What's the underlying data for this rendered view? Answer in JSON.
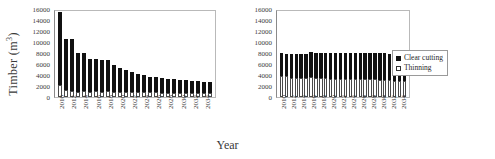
{
  "figure": {
    "xlabel": "Year",
    "ylabel_text": "Timber (m",
    "ylabel_unit": "3",
    "ylabel_close": ")"
  },
  "legend": {
    "position": "right",
    "items": [
      {
        "label": "Clear cutting",
        "swatch": "filled-black-square"
      },
      {
        "label": "Thinning",
        "swatch": "open-white-square"
      }
    ]
  },
  "axis": {
    "yticks": [
      16000,
      14000,
      12000,
      10000,
      8000,
      6000,
      4000,
      2000,
      0
    ],
    "ylim": [
      0,
      16000
    ],
    "ytick_labels": [
      "16000",
      "14000",
      "12000",
      "10000",
      "8000",
      "6000",
      "4000",
      "2000",
      "0"
    ]
  },
  "chart_data": [
    {
      "id": "left-panel",
      "type": "bar",
      "stacked": true,
      "title": "",
      "xlabel": "Year",
      "ylabel": "Timber (m3)",
      "ylim": [
        0,
        16000
      ],
      "grid": false,
      "legend": "none",
      "categories": [
        "2010",
        "2011",
        "2012",
        "2013",
        "2014",
        "2015",
        "2016",
        "2017",
        "2018",
        "2019",
        "2020",
        "2021",
        "2022",
        "2023",
        "2024",
        "2025",
        "2026",
        "2027",
        "2028",
        "2029",
        "2030",
        "2031",
        "2032",
        "2033",
        "2034",
        "2035"
      ],
      "tick_labels_shown": [
        "2010",
        "",
        "2012",
        "",
        "2014",
        "",
        "2016",
        "",
        "2018",
        "",
        "2020",
        "",
        "2022",
        "",
        "2024",
        "",
        "2026",
        "",
        "2028",
        "",
        "2030",
        "",
        "2032",
        "",
        "2034",
        ""
      ],
      "series": [
        {
          "name": "Thinning",
          "values": [
            2100,
            1300,
            1100,
            900,
            1100,
            1000,
            1050,
            1000,
            1050,
            1000,
            1000,
            950,
            950,
            900,
            900,
            850,
            850,
            800,
            800,
            800,
            750,
            750,
            750,
            700,
            700,
            700
          ]
        },
        {
          "name": "Clear cutting",
          "values": [
            13400,
            9300,
            9400,
            7100,
            6900,
            6000,
            5800,
            5700,
            5600,
            4750,
            4250,
            3900,
            3550,
            3300,
            3050,
            2850,
            2750,
            2700,
            2550,
            2450,
            2350,
            2300,
            2250,
            2150,
            2100,
            2000
          ]
        }
      ],
      "totals": [
        15500,
        10600,
        10500,
        8000,
        8000,
        7000,
        6850,
        6700,
        6650,
        5750,
        5250,
        4850,
        4500,
        4200,
        3950,
        3700,
        3600,
        3500,
        3350,
        3250,
        3100,
        3050,
        3000,
        2850,
        2800,
        2700
      ]
    },
    {
      "id": "right-panel",
      "type": "bar",
      "stacked": true,
      "title": "",
      "xlabel": "Year",
      "ylabel": "",
      "ylim": [
        0,
        16000
      ],
      "grid": false,
      "legend": "right",
      "categories": [
        "2010",
        "2011",
        "2012",
        "2013",
        "2014",
        "2015",
        "2016",
        "2017",
        "2018",
        "2019",
        "2020",
        "2021",
        "2022",
        "2023",
        "2024",
        "2025",
        "2026",
        "2027",
        "2028",
        "2029",
        "2030",
        "2031",
        "2032",
        "2033",
        "2034",
        "2035"
      ],
      "tick_labels_shown": [
        "2010",
        "",
        "2012",
        "",
        "2014",
        "",
        "2016",
        "",
        "2018",
        "",
        "2020",
        "",
        "2022",
        "",
        "2024",
        "",
        "2026",
        "",
        "2028",
        "",
        "2030",
        "",
        "2032",
        "",
        "2034",
        ""
      ],
      "series": [
        {
          "name": "Thinning",
          "values": [
            3900,
            3750,
            3500,
            3500,
            3400,
            3450,
            3700,
            3500,
            3500,
            3400,
            3350,
            3300,
            3300,
            3250,
            3300,
            3200,
            3250,
            3200,
            3200,
            3250,
            3150,
            3100,
            3050,
            3000,
            3000,
            2950
          ]
        },
        {
          "name": "Clear cutting",
          "values": [
            4100,
            4150,
            4400,
            4400,
            4450,
            4400,
            4400,
            4450,
            4500,
            4550,
            4600,
            4650,
            4650,
            4700,
            4650,
            4750,
            4750,
            4800,
            4800,
            4800,
            4900,
            4850,
            4850,
            4850,
            4850,
            4750
          ]
        }
      ],
      "totals": [
        8000,
        7900,
        7900,
        7900,
        7850,
        7850,
        8100,
        7950,
        8000,
        7950,
        7950,
        7950,
        7950,
        7950,
        7950,
        7950,
        8000,
        8000,
        8000,
        8050,
        8050,
        7950,
        7900,
        7850,
        7850,
        7700
      ]
    }
  ]
}
